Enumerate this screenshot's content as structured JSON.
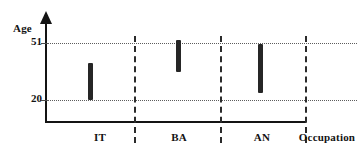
{
  "chart_data": {
    "type": "bar",
    "title": "",
    "subtitle": "",
    "xlabel": "Occupation",
    "ylabel": "Age",
    "categories": [
      "IT",
      "BA",
      "AN"
    ],
    "series": [
      {
        "name": "Age range",
        "low": [
          20,
          31,
          23
        ],
        "high": [
          37,
          51,
          49
        ]
      }
    ],
    "ytick_labels": [
      "51",
      "20"
    ],
    "ytick_values": [
      51,
      20
    ],
    "ylim": [
      0,
      62
    ],
    "grid": "horizontal-dotted",
    "legend": "none"
  },
  "axes": {
    "y_title": "Age",
    "x_title": "Occupation",
    "ticks": [
      {
        "label": "51",
        "value": 51
      },
      {
        "label": "20",
        "value": 20
      }
    ]
  },
  "bars": [
    {
      "label": "IT",
      "top_px": 63,
      "bottom_px": 100,
      "center_x_px": 90,
      "low": 20,
      "high": 37
    },
    {
      "label": "BA",
      "top_px": 40,
      "bottom_px": 72,
      "center_x_px": 178,
      "low": 31,
      "high": 51
    },
    {
      "label": "AN",
      "top_px": 44,
      "bottom_px": 93,
      "center_x_px": 260,
      "low": 23,
      "high": 49
    }
  ],
  "category_labels": [
    {
      "text": "IT",
      "x_px": 100
    },
    {
      "text": "BA",
      "x_px": 179
    },
    {
      "text": "AN",
      "x_px": 262
    }
  ],
  "x_axis_title_pos": {
    "text": "Occupation",
    "x_px": 327
  },
  "colors": {
    "bar": "#262626",
    "axis": "#141414",
    "gridline": "#5d5d5d",
    "separator": "#2b2b2b",
    "text": "#131313",
    "background": "#ffffff"
  }
}
